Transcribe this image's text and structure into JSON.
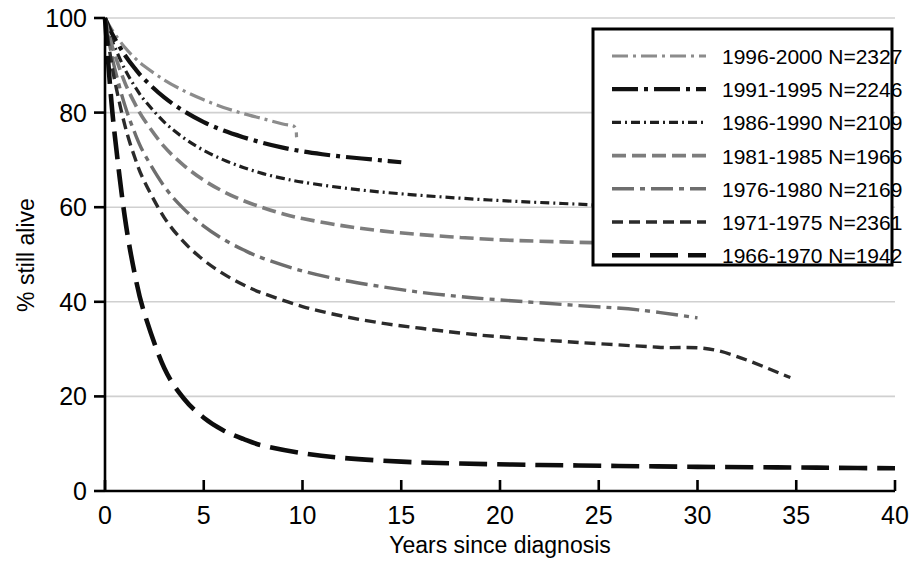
{
  "chart_data": {
    "type": "line",
    "title": "",
    "subtitle": "",
    "xlabel": "Years since diagnosis",
    "ylabel": "% still alive",
    "xlim": [
      0,
      40
    ],
    "ylim": [
      0,
      100
    ],
    "xticks": [
      "0",
      "5",
      "10",
      "15",
      "20",
      "25",
      "30",
      "35",
      "40"
    ],
    "xtick_values": [
      0,
      5,
      10,
      15,
      20,
      25,
      30,
      35,
      40
    ],
    "yticks": [
      "0",
      "20",
      "40",
      "60",
      "80",
      "100"
    ],
    "ytick_values": [
      0,
      20,
      40,
      60,
      80,
      100
    ],
    "grid": "horizontal",
    "legend_position": "top-right",
    "series": [
      {
        "name": "1996-2000",
        "label": "1996-2000  N=2327",
        "n": 2327,
        "color": "#8c8c8c",
        "dash": "16,5,3,5,16,5,3,5",
        "width": 3.2,
        "x": [
          0,
          0.25,
          0.5,
          1,
          1.5,
          2,
          3,
          4,
          5,
          6,
          7,
          8,
          9,
          9.6,
          9.7
        ],
        "y": [
          100,
          98.2,
          96.6,
          93.8,
          91.6,
          89.8,
          86.9,
          84.6,
          82.7,
          81.1,
          79.8,
          78.7,
          77.6,
          77.0,
          74.8
        ]
      },
      {
        "name": "1991-1995",
        "label": "1991-1995  N=2246",
        "n": 2246,
        "color": "#111111",
        "dash": "26,6,4,6,26,6,4,6",
        "width": 4.2,
        "x": [
          0,
          0.25,
          0.5,
          1,
          1.5,
          2,
          3,
          4,
          5,
          6,
          7,
          8,
          9,
          10,
          11,
          12,
          13,
          14,
          15
        ],
        "y": [
          100,
          97.6,
          95.6,
          92.2,
          89.4,
          87.0,
          83.2,
          80.3,
          78.0,
          76.2,
          74.8,
          73.6,
          72.6,
          71.8,
          71.2,
          70.7,
          70.3,
          69.9,
          69.5
        ]
      },
      {
        "name": "1986-1990",
        "label": "1986-1990  N=2109",
        "n": 2109,
        "color": "#1f1f1f",
        "dash": "9,4,2,4,9,4,2,4",
        "width": 3.2,
        "x": [
          0,
          0.25,
          0.5,
          1,
          1.5,
          2,
          3,
          4,
          5,
          6,
          7,
          8,
          9,
          10,
          12,
          14,
          16,
          18,
          20,
          22,
          24.7
        ],
        "y": [
          100,
          96.6,
          93.8,
          89.2,
          85.6,
          82.6,
          78.0,
          74.6,
          72.0,
          70.0,
          68.4,
          67.1,
          66.1,
          65.3,
          64.1,
          63.2,
          62.5,
          61.9,
          61.4,
          61.0,
          60.5
        ]
      },
      {
        "name": "1981-1985",
        "label": "1981-1985  N=1966",
        "n": 1966,
        "color": "#7d7d7d",
        "dash": "14,6",
        "width": 3.6,
        "x": [
          0,
          0.25,
          0.5,
          1,
          1.5,
          2,
          3,
          4,
          5,
          6,
          7,
          8,
          9,
          10,
          12,
          14,
          16,
          18,
          20,
          22,
          24.7
        ],
        "y": [
          100,
          95.8,
          92.2,
          86.4,
          82.0,
          78.4,
          72.8,
          68.8,
          65.7,
          63.3,
          61.4,
          59.9,
          58.6,
          57.6,
          56.1,
          55.0,
          54.2,
          53.6,
          53.1,
          52.8,
          52.5
        ]
      },
      {
        "name": "1976-1980",
        "label": "1976-1980  N=2169",
        "n": 2169,
        "color": "#6e6e6e",
        "dash": "22,6,5,6",
        "width": 3.4,
        "x": [
          0,
          0.25,
          0.5,
          1,
          1.5,
          2,
          3,
          4,
          5,
          6,
          7,
          8,
          10,
          12,
          14,
          16,
          18,
          20,
          24,
          27,
          30
        ],
        "y": [
          100,
          94.0,
          89.2,
          81.6,
          75.8,
          71.2,
          64.4,
          59.6,
          56.0,
          53.2,
          51.0,
          49.2,
          46.5,
          44.6,
          43.2,
          42.0,
          41.1,
          40.4,
          39.2,
          38.3,
          36.6
        ]
      },
      {
        "name": "1971-1975",
        "label": "1971-1975  N=2361",
        "n": 2361,
        "color": "#2b2b2b",
        "dash": "11,6",
        "width": 3.4,
        "x": [
          0,
          0.25,
          0.5,
          1,
          1.5,
          2,
          3,
          4,
          5,
          6,
          7,
          8,
          10,
          12,
          14,
          16,
          18,
          20,
          24,
          28,
          31,
          34.7
        ],
        "y": [
          100,
          92.6,
          86.6,
          77.4,
          70.6,
          65.4,
          57.8,
          52.6,
          48.8,
          45.9,
          43.6,
          41.8,
          39.0,
          37.0,
          35.5,
          34.4,
          33.4,
          32.6,
          31.4,
          30.4,
          29.7,
          24.0
        ]
      },
      {
        "name": "1966-1970",
        "label": "1966-1970  N=1942",
        "n": 1942,
        "color": "#0d0d0d",
        "dash": "28,10",
        "width": 4.6,
        "x": [
          0,
          0.25,
          0.5,
          1,
          1.5,
          2,
          3,
          4,
          5,
          6,
          7,
          8,
          10,
          12,
          15,
          18,
          22,
          26,
          30,
          34,
          37,
          40
        ],
        "y": [
          100,
          86.0,
          75.0,
          58.0,
          46.0,
          37.5,
          26.0,
          19.5,
          15.5,
          12.8,
          11.0,
          9.6,
          8.0,
          7.0,
          6.2,
          5.8,
          5.5,
          5.3,
          5.1,
          5.0,
          4.9,
          4.8
        ]
      }
    ]
  },
  "axes": {
    "x_title": "Years since diagnosis",
    "y_title": "% still alive"
  },
  "colors": {
    "grid": "#d0d0d0",
    "axis": "#000000",
    "background": "#ffffff",
    "legend_border": "#000000"
  }
}
